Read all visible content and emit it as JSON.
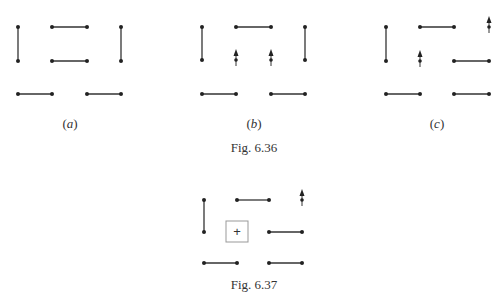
{
  "figures": [
    {
      "id": "fig-6-36",
      "caption": "Fig. 6.36",
      "panels": [
        {
          "label": "(a)",
          "label_letter": "a",
          "dots": [
            [
              18,
              27
            ],
            [
              52,
              27
            ],
            [
              87,
              27
            ],
            [
              121,
              27
            ],
            [
              18,
              61
            ],
            [
              52,
              61
            ],
            [
              87,
              61
            ],
            [
              121,
              61
            ],
            [
              18,
              94
            ],
            [
              52,
              94
            ],
            [
              87,
              94
            ],
            [
              121,
              94
            ]
          ],
          "segments": [
            [
              [
                18,
                27
              ],
              [
                18,
                61
              ]
            ],
            [
              [
                52,
                27
              ],
              [
                87,
                27
              ]
            ],
            [
              [
                121,
                27
              ],
              [
                121,
                61
              ]
            ],
            [
              [
                52,
                61
              ],
              [
                87,
                61
              ]
            ],
            [
              [
                18,
                94
              ],
              [
                52,
                94
              ]
            ],
            [
              [
                87,
                94
              ],
              [
                121,
                94
              ]
            ]
          ],
          "arrows": []
        },
        {
          "label": "(b)",
          "label_letter": "b",
          "dots": [
            [
              202,
              27
            ],
            [
              236,
              27
            ],
            [
              271,
              27
            ],
            [
              305,
              27
            ],
            [
              202,
              60
            ],
            [
              305,
              60
            ],
            [
              202,
              94
            ],
            [
              236,
              94
            ],
            [
              271,
              94
            ],
            [
              305,
              94
            ]
          ],
          "segments": [
            [
              [
                202,
                27
              ],
              [
                202,
                60
              ]
            ],
            [
              [
                236,
                27
              ],
              [
                271,
                27
              ]
            ],
            [
              [
                305,
                27
              ],
              [
                305,
                60
              ]
            ],
            [
              [
                202,
                94
              ],
              [
                236,
                94
              ]
            ],
            [
              [
                271,
                94
              ],
              [
                305,
                94
              ]
            ]
          ],
          "arrows": [
            [
              236,
              60
            ],
            [
              271,
              60
            ]
          ]
        },
        {
          "label": "(c)",
          "label_letter": "c",
          "dots": [
            [
              386,
              27
            ],
            [
              420,
              27
            ],
            [
              454,
              27
            ],
            [
              386,
              61
            ],
            [
              454,
              61
            ],
            [
              489,
              61
            ],
            [
              386,
              94
            ],
            [
              420,
              94
            ],
            [
              454,
              94
            ],
            [
              489,
              94
            ]
          ],
          "segments": [
            [
              [
                386,
                27
              ],
              [
                386,
                61
              ]
            ],
            [
              [
                420,
                27
              ],
              [
                454,
                27
              ]
            ],
            [
              [
                454,
                61
              ],
              [
                489,
                61
              ]
            ],
            [
              [
                386,
                94
              ],
              [
                420,
                94
              ]
            ],
            [
              [
                454,
                94
              ],
              [
                489,
                94
              ]
            ]
          ],
          "arrows": [
            [
              420,
              61
            ],
            [
              489,
              27
            ]
          ]
        }
      ]
    },
    {
      "id": "fig-6-37",
      "caption": "Fig. 6.37",
      "dots": [
        [
          204,
          200
        ],
        [
          237,
          200
        ],
        [
          269,
          200
        ],
        [
          204,
          232
        ],
        [
          269,
          232
        ],
        [
          302,
          232
        ],
        [
          204,
          263
        ],
        [
          237,
          263
        ],
        [
          269,
          263
        ],
        [
          302,
          263
        ]
      ],
      "segments": [
        [
          [
            204,
            200
          ],
          [
            204,
            232
          ]
        ],
        [
          [
            237,
            200
          ],
          [
            269,
            200
          ]
        ],
        [
          [
            269,
            232
          ],
          [
            302,
            232
          ]
        ],
        [
          [
            204,
            263
          ],
          [
            237,
            263
          ]
        ],
        [
          [
            269,
            263
          ],
          [
            302,
            263
          ]
        ]
      ],
      "arrows": [
        [
          302,
          200
        ]
      ],
      "box": {
        "x": 226,
        "y": 221,
        "w": 22,
        "h": 21,
        "symbol": "+"
      }
    }
  ],
  "colors": {
    "line": "#333333",
    "dot": "#222222",
    "box_border": "#999999"
  }
}
